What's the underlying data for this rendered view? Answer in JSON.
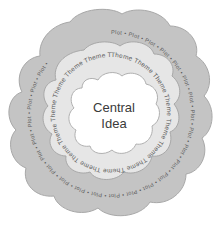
{
  "diagram": {
    "type": "concentric-clouds",
    "colors": {
      "outer_fill": "#c4c4c4",
      "middle_fill": "#e6e6e6",
      "inner_fill": "#ffffff",
      "outline": "#a8a8a8",
      "text": "#5a5a5a"
    },
    "outer_ring": {
      "label": "Plot",
      "text": "Plot • Plot • Plot • Plot • Plot • Plot • Plot • Plot • Plot • Plot • Plot • Plot • Plot • Plot • Plot • Plot • Plot • Plot • Plot • Plot • Plot • Plot • Plot • Plot • Plot • "
    },
    "middle_ring": {
      "label": "Theme",
      "text": "Theme Theme Theme Theme Theme Theme Theme Theme Theme Theme Theme Theme Theme Theme Theme Theme "
    },
    "center": {
      "line1": "Central",
      "line2": "Idea"
    }
  }
}
